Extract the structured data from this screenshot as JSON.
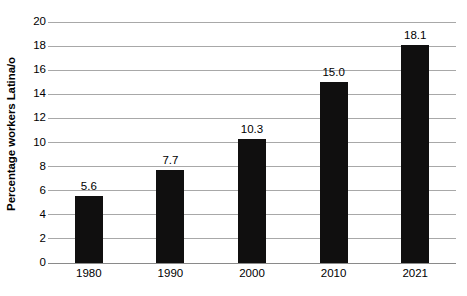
{
  "chart_data": {
    "type": "bar",
    "title": "",
    "subtitle": "",
    "xlabel": "",
    "ylabel": "Percentage workers Latina/o",
    "categories": [
      "1980",
      "1990",
      "2000",
      "2010",
      "2021"
    ],
    "values": [
      5.6,
      7.7,
      10.3,
      15.0,
      18.1
    ],
    "value_labels": [
      "5.6",
      "7.7",
      "10.3",
      "15.0",
      "18.1"
    ],
    "ylim": [
      0,
      20
    ],
    "ytick_values": [
      0,
      2,
      4,
      6,
      8,
      10,
      12,
      14,
      16,
      18,
      20
    ],
    "ytick_labels": [
      "0",
      "2",
      "4",
      "6",
      "8",
      "10",
      "12",
      "14",
      "16",
      "18",
      "20"
    ],
    "grid": true,
    "grid_axis": "y",
    "legend": false,
    "legend_position": "none",
    "bar_color": "#100f0f",
    "grid_color": "#a8a8a8",
    "background_color": "#ffffff",
    "text_color": "#000000",
    "series": [
      {
        "name": "Percentage workers Latina/o",
        "values": [
          5.6,
          7.7,
          10.3,
          15.0,
          18.1
        ]
      }
    ]
  }
}
